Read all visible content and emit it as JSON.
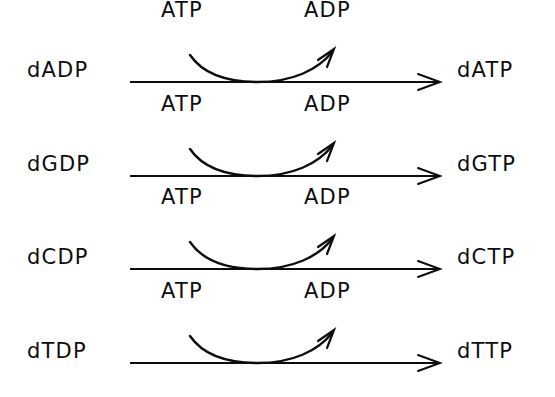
{
  "diagram": {
    "background_color": "#ffffff",
    "stroke_color": "#0d0d0d",
    "rows": [
      {
        "substrate": "dADP",
        "product": "dATP",
        "cofactor_in": "ATP",
        "cofactor_out": "ADP"
      },
      {
        "substrate": "dGDP",
        "product": "dGTP",
        "cofactor_in": "ATP",
        "cofactor_out": "ADP"
      },
      {
        "substrate": "dCDP",
        "product": "dCTP",
        "cofactor_in": "ATP",
        "cofactor_out": "ADP"
      },
      {
        "substrate": "dTDP",
        "product": "dTTP",
        "cofactor_in": "ATP",
        "cofactor_out": "ADP"
      }
    ]
  }
}
